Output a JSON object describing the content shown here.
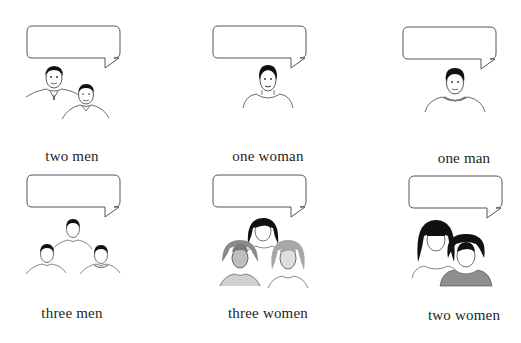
{
  "cells": [
    {
      "caption": "two men",
      "bubble_text": "",
      "figure": "two-men-illustration"
    },
    {
      "caption": "one woman",
      "bubble_text": "",
      "figure": "one-woman-illustration"
    },
    {
      "caption": "one man",
      "bubble_text": "",
      "figure": "one-man-illustration"
    },
    {
      "caption": "three men",
      "bubble_text": "",
      "figure": "three-men-illustration"
    },
    {
      "caption": "three women",
      "bubble_text": "",
      "figure": "three-women-illustration"
    },
    {
      "caption": "two women",
      "bubble_text": "",
      "figure": "two-women-illustration"
    }
  ],
  "colors": {
    "line": "#555555",
    "hair": "#111111",
    "grey_fill": "#9a9a9a",
    "light_grey_fill": "#c8c8c8",
    "text": "#1e1e1e"
  }
}
